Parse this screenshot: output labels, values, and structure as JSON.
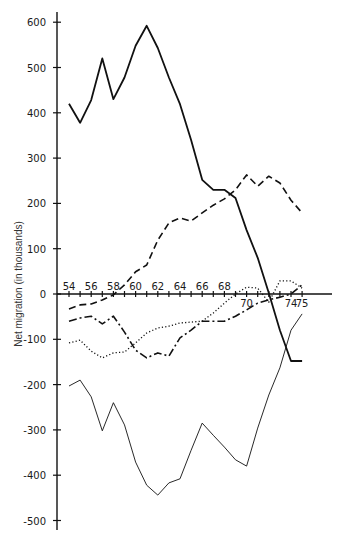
{
  "chart_data": {
    "type": "line",
    "title": "",
    "xlabel": "",
    "ylabel": "Net migration (in thousands)",
    "x": [
      54,
      55,
      56,
      57,
      58,
      59,
      60,
      61,
      62,
      63,
      64,
      65,
      66,
      67,
      68,
      69,
      70,
      71,
      72,
      73,
      74,
      75
    ],
    "x_tick_labels": [
      "54",
      "56",
      "58",
      "60",
      "62",
      "64",
      "66",
      "68",
      "70",
      "74",
      "75"
    ],
    "x_tick_values": [
      54,
      56,
      58,
      60,
      62,
      64,
      66,
      68,
      70,
      74,
      75
    ],
    "y_tick_labels": [
      "600",
      "500",
      "400",
      "300",
      "200",
      "100",
      "0",
      "-100",
      "-200",
      "-300",
      "-400",
      "-500"
    ],
    "y_tick_values": [
      600,
      500,
      400,
      300,
      200,
      100,
      0,
      -100,
      -200,
      -300,
      -400,
      -500
    ],
    "ylim": [
      -520,
      625
    ],
    "xlim": [
      53.5,
      77
    ],
    "grid": false,
    "legend": null,
    "series": [
      {
        "name": "thick solid",
        "style": "thick-solid",
        "values": [
          420,
          378,
          428,
          520,
          430,
          478,
          548,
          592,
          543,
          478,
          419,
          340,
          252,
          230,
          230,
          212,
          141,
          80,
          2,
          -80,
          -148,
          -148
        ]
      },
      {
        "name": "dashed",
        "style": "dashed",
        "values": [
          -33,
          -24,
          -22,
          -13,
          -2,
          20,
          49,
          64,
          119,
          157,
          168,
          161,
          179,
          196,
          210,
          230,
          263,
          238,
          260,
          245,
          207,
          179
        ]
      },
      {
        "name": "dash-dot",
        "style": "dash-dot",
        "values": [
          -60,
          -53,
          -49,
          -66,
          -49,
          -84,
          -124,
          -141,
          -130,
          -137,
          -97,
          -80,
          -60,
          -60,
          -60,
          -49,
          -35,
          -20,
          -13,
          -7,
          0,
          20
        ]
      },
      {
        "name": "dotted",
        "style": "dotted",
        "values": [
          -108,
          -102,
          -126,
          -141,
          -130,
          -128,
          -108,
          -86,
          -75,
          -71,
          -64,
          -62,
          -60,
          -42,
          -20,
          0,
          15,
          13,
          -18,
          29,
          29,
          13
        ]
      },
      {
        "name": "thin solid",
        "style": "thin-solid",
        "values": [
          -203,
          -190,
          -227,
          -302,
          -240,
          -289,
          -371,
          -422,
          -444,
          -417,
          -408,
          -345,
          -285,
          -312,
          -338,
          -366,
          -380,
          -296,
          -223,
          -163,
          -80,
          -44
        ]
      }
    ]
  }
}
